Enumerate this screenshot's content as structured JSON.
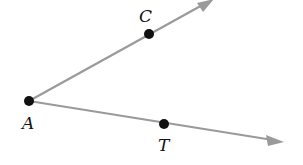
{
  "diagram": {
    "type": "geometry-angle",
    "line_color": "#999999",
    "point_color": "#111111",
    "points": [
      {
        "label": "A",
        "x": 29,
        "y": 101
      },
      {
        "label": "C",
        "x": 149,
        "y": 34
      },
      {
        "label": "T",
        "x": 164,
        "y": 124
      }
    ],
    "rays": [
      {
        "from": "A",
        "through": "C",
        "end": [
          212,
          0
        ]
      },
      {
        "from": "A",
        "through": "T",
        "end": [
          283,
          142
        ]
      }
    ],
    "labels": {
      "A": "A",
      "C": "C",
      "T": "T"
    }
  }
}
